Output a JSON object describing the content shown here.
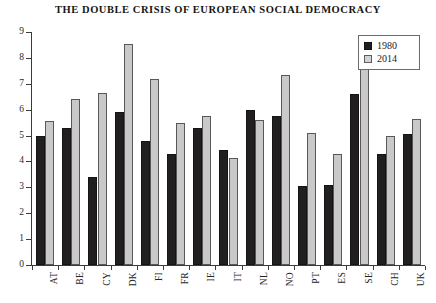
{
  "chart_data": {
    "type": "bar",
    "title": "THE DOUBLE CRISIS OF EUROPEAN SOCIAL DEMOCRACY",
    "xlabel": "",
    "ylabel": "",
    "ylim": [
      0,
      9
    ],
    "yticks": [
      0,
      1,
      2,
      3,
      4,
      5,
      6,
      7,
      8,
      9
    ],
    "grid": false,
    "legend_position": "top-right",
    "categories": [
      "AT",
      "BE",
      "CY",
      "DK",
      "FI",
      "FR",
      "IE",
      "IT",
      "NL",
      "NO",
      "PT",
      "ES",
      "SE",
      "CH",
      "UK"
    ],
    "series": [
      {
        "name": "1980",
        "color": "#211f20",
        "values": [
          5.0,
          5.3,
          3.4,
          5.9,
          4.8,
          4.3,
          5.3,
          4.45,
          6.0,
          5.75,
          3.05,
          3.1,
          6.6,
          4.3,
          5.05
        ]
      },
      {
        "name": "2014",
        "color": "#c9c9c9",
        "values": [
          5.55,
          6.4,
          6.65,
          8.55,
          7.2,
          5.5,
          5.75,
          4.15,
          5.6,
          7.35,
          5.1,
          4.3,
          7.7,
          5.0,
          5.65
        ]
      }
    ]
  }
}
